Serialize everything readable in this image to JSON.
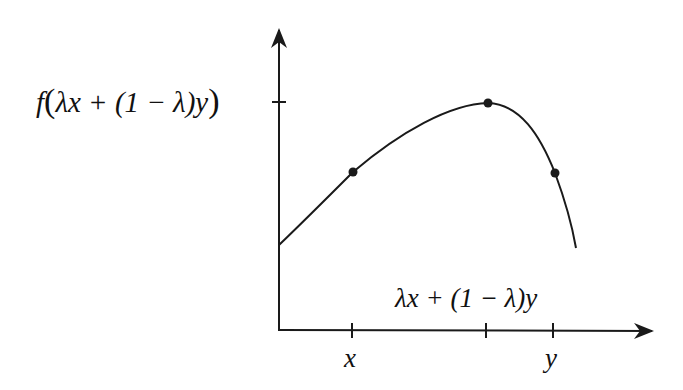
{
  "diagram": {
    "type": "concave-function-illustration",
    "y_label": {
      "f": "f",
      "open": "(",
      "inner": "λx + (1 − λ)y",
      "close": ")"
    },
    "x_mid_label": "λx + (1 − λ)y",
    "x_ticks": [
      {
        "label": "x",
        "px": 352
      },
      {
        "label": "",
        "px": 486
      },
      {
        "label": "y",
        "px": 553
      }
    ],
    "points": [
      {
        "name": "point-x",
        "px": 353,
        "py": 172
      },
      {
        "name": "point-mid",
        "px": 488,
        "py": 103
      },
      {
        "name": "point-y",
        "px": 555,
        "py": 173
      }
    ],
    "colors": {
      "stroke": "#1a1a1a",
      "background": "#ffffff"
    }
  }
}
